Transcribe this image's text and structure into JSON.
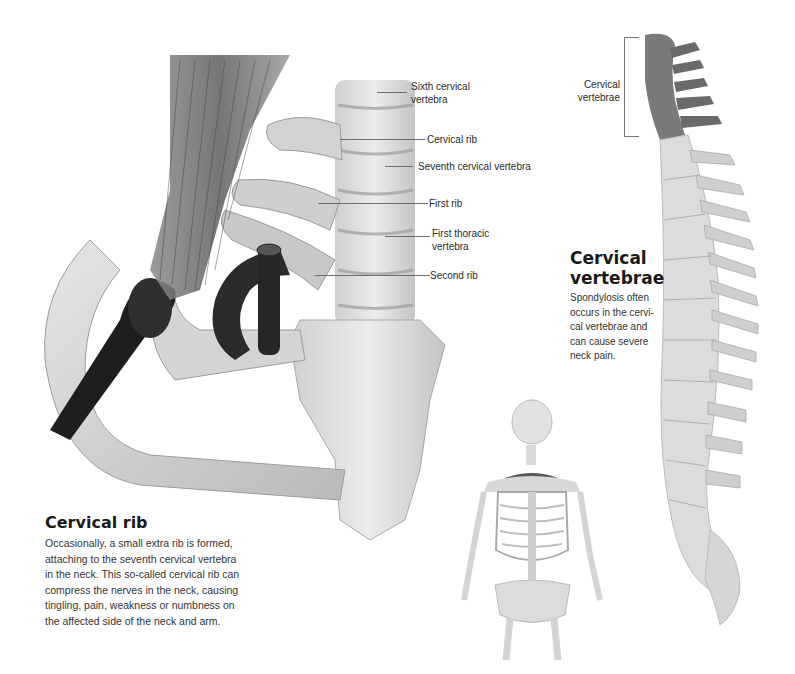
{
  "page": {
    "background": "#ffffff"
  },
  "main_illustration": {
    "name": "cervical-rib-closeup",
    "labels": [
      {
        "id": "sixth",
        "text_line1": "Sixth cervical",
        "text_line2": "vertebra"
      },
      {
        "id": "cervical_rib",
        "text_line1": "Cervical rib"
      },
      {
        "id": "seventh",
        "text_line1": "Seventh cervical vertebra"
      },
      {
        "id": "first_rib",
        "text_line1": "First rib"
      },
      {
        "id": "first_thoracic",
        "text_line1": "First thoracic",
        "text_line2": "vertebra"
      },
      {
        "id": "second_rib",
        "text_line1": "Second rib"
      }
    ]
  },
  "spine_illustration": {
    "bracket_label_line1": "Cervical",
    "bracket_label_line2": "vertebrae",
    "highlight_color": "#6f6f6f"
  },
  "sidebar_box": {
    "title_line1": "Cervical",
    "title_line2": "vertebrae",
    "body_lines": [
      "Spondylosis often",
      "occurs in the cervi-",
      "cal vertebrae and",
      "can cause severe",
      "neck pain."
    ]
  },
  "cervical_rib_box": {
    "title": "Cervical rib",
    "body_lines": [
      "Occasionally, a small extra rib is formed,",
      "attaching to the seventh cervical vertebra",
      "in the neck. This so-called cervical rib can",
      "compress the nerves in the neck, causing",
      "tingling, pain, weakness or numbness on",
      "the affected side of the neck and arm."
    ]
  }
}
